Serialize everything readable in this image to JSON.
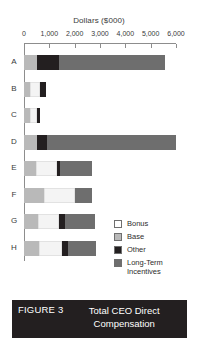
{
  "chart_data": {
    "type": "bar",
    "orientation": "horizontal",
    "stacked": true,
    "title": "Total CEO Direct Compensation",
    "xlabel": "Dollars ($000)",
    "ylabel": "",
    "xlim": [
      0,
      6000
    ],
    "xticks": [
      "0",
      "1,000",
      "2,000",
      "3,000",
      "4,000",
      "5,000",
      "6,000"
    ],
    "xtick_values": [
      0,
      1000,
      2000,
      3000,
      4000,
      5000,
      6000
    ],
    "grid": false,
    "legend_position": "center-right",
    "categories": [
      "A",
      "B",
      "C",
      "D",
      "E",
      "F",
      "G",
      "H"
    ],
    "series": [
      {
        "name": "Base",
        "color": "#b9b9b9",
        "values": [
          500,
          250,
          250,
          500,
          480,
          800,
          550,
          600
        ]
      },
      {
        "name": "Bonus",
        "color": "#f4f4f4",
        "values": [
          0,
          400,
          250,
          0,
          830,
          1200,
          850,
          900
        ]
      },
      {
        "name": "Other",
        "color": "#231f20",
        "values": [
          900,
          200,
          150,
          400,
          120,
          0,
          200,
          250
        ]
      },
      {
        "name": "Long-Term Incentives",
        "color": "#6e6e6e",
        "values": [
          4150,
          0,
          0,
          5100,
          1270,
          700,
          1200,
          1100
        ]
      }
    ],
    "totals": [
      5550,
      850,
      650,
      6000,
      2700,
      2700,
      2800,
      2850
    ],
    "legend": [
      {
        "label": "Bonus",
        "color": "#ffffff"
      },
      {
        "label": "Base",
        "color": "#b9b9b9"
      },
      {
        "label": "Other",
        "color": "#231f20"
      },
      {
        "label": "Long-Term\nIncentives",
        "color": "#6e6e6e"
      }
    ]
  },
  "caption": {
    "tag": "FIGURE 3",
    "text": "Total CEO Direct Compensation"
  }
}
